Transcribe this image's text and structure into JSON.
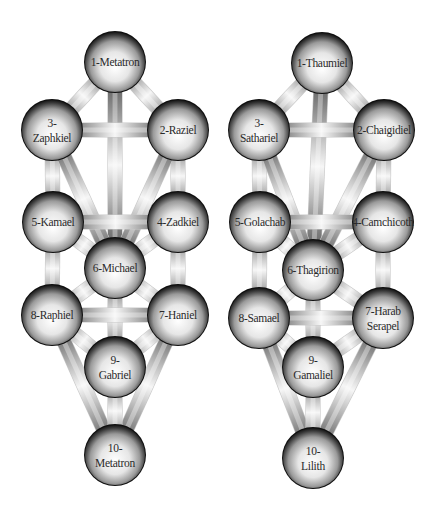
{
  "diagram": {
    "type": "tree-of-life-comparison",
    "colors": {
      "background": "#ffffff",
      "sphere_light": "#ffffff",
      "sphere_mid": "#bdbdbd",
      "sphere_dark": "#1a1a1a",
      "path_light": "#f4f4f4",
      "path_dark": "#4a4a4a",
      "label": "#2a2a2a"
    },
    "trees": [
      {
        "id": "left",
        "name": "Tree of Life (Archangels)",
        "offset_x": 0,
        "nodes": [
          {
            "id": 1,
            "lines": [
              "1-Metatron"
            ],
            "x": 115,
            "y": 62
          },
          {
            "id": 2,
            "lines": [
              "2-Raziel"
            ],
            "x": 178,
            "y": 130
          },
          {
            "id": 3,
            "lines": [
              "3-",
              "Zaphkiel"
            ],
            "x": 52,
            "y": 130
          },
          {
            "id": 4,
            "lines": [
              "4-Zadkiel"
            ],
            "x": 178,
            "y": 222
          },
          {
            "id": 5,
            "lines": [
              "5-Kamael"
            ],
            "x": 53,
            "y": 222
          },
          {
            "id": 6,
            "lines": [
              "6-Michael"
            ],
            "x": 115,
            "y": 268
          },
          {
            "id": 7,
            "lines": [
              "7-Haniel"
            ],
            "x": 178,
            "y": 315
          },
          {
            "id": 8,
            "lines": [
              "8-Raphiel"
            ],
            "x": 52,
            "y": 315
          },
          {
            "id": 9,
            "lines": [
              "9-",
              "Gabriel"
            ],
            "x": 115,
            "y": 367
          },
          {
            "id": 10,
            "lines": [
              "10-",
              "Metatron"
            ],
            "x": 115,
            "y": 455
          }
        ]
      },
      {
        "id": "right",
        "name": "Tree of Death (Qliphoth)",
        "offset_x": 0,
        "nodes": [
          {
            "id": 1,
            "lines": [
              "1-Thaumiel"
            ],
            "x": 322,
            "y": 63
          },
          {
            "id": 2,
            "lines": [
              "2-Chaigidiel"
            ],
            "x": 384,
            "y": 130
          },
          {
            "id": 3,
            "lines": [
              "3-",
              "Sathariel"
            ],
            "x": 259,
            "y": 130
          },
          {
            "id": 4,
            "lines": [
              "4-Camchicoth"
            ],
            "x": 383,
            "y": 222
          },
          {
            "id": 5,
            "lines": [
              "5-Golachab"
            ],
            "x": 260,
            "y": 222
          },
          {
            "id": 6,
            "lines": [
              "6-Thagirion"
            ],
            "x": 313,
            "y": 270
          },
          {
            "id": 7,
            "lines": [
              "7-Harab",
              "Serapel"
            ],
            "x": 383,
            "y": 318
          },
          {
            "id": 8,
            "lines": [
              "8-Samael"
            ],
            "x": 259,
            "y": 318
          },
          {
            "id": 9,
            "lines": [
              "9-",
              "Gamaliel"
            ],
            "x": 313,
            "y": 367
          },
          {
            "id": 10,
            "lines": [
              "10-",
              "Lilith"
            ],
            "x": 313,
            "y": 458
          }
        ]
      }
    ],
    "paths": [
      [
        1,
        2
      ],
      [
        1,
        3
      ],
      [
        1,
        6
      ],
      [
        2,
        3
      ],
      [
        2,
        4
      ],
      [
        2,
        6
      ],
      [
        3,
        5
      ],
      [
        3,
        6
      ],
      [
        4,
        5
      ],
      [
        4,
        6
      ],
      [
        4,
        7
      ],
      [
        5,
        6
      ],
      [
        5,
        8
      ],
      [
        6,
        7
      ],
      [
        6,
        8
      ],
      [
        6,
        9
      ],
      [
        7,
        8
      ],
      [
        7,
        9
      ],
      [
        7,
        10
      ],
      [
        8,
        9
      ],
      [
        8,
        10
      ],
      [
        9,
        10
      ]
    ],
    "node_radius": 30,
    "path_width": 14
  }
}
